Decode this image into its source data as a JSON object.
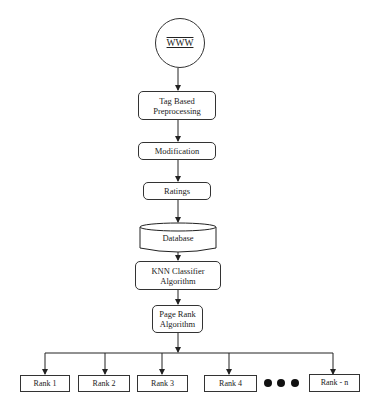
{
  "diagram": {
    "type": "flowchart",
    "nodes": {
      "www": {
        "label": "WWW",
        "shape": "circle"
      },
      "tag_based": {
        "label_line1": "Tag Based",
        "label_line2": "Preprocessing",
        "shape": "rounded-rect"
      },
      "modification": {
        "label": "Modification",
        "shape": "rounded-rect"
      },
      "ratings": {
        "label": "Ratings",
        "shape": "rounded-rect"
      },
      "database": {
        "label": "Database",
        "shape": "cylinder"
      },
      "knn": {
        "label_line1": "KNN Classifier",
        "label_line2": "Algorithm",
        "shape": "rounded-rect"
      },
      "page_rank": {
        "label_line1": "Page Rank",
        "label_line2": "Algorithm",
        "shape": "rounded-rect"
      }
    },
    "ranks": [
      {
        "label": "Rank 1"
      },
      {
        "label": "Rank 2"
      },
      {
        "label": "Rank 3"
      },
      {
        "label": "Rank 4"
      },
      {
        "label": "Rank - n"
      }
    ],
    "ellipsis": "dots-icon",
    "edges": [
      [
        "www",
        "tag_based"
      ],
      [
        "tag_based",
        "modification"
      ],
      [
        "modification",
        "ratings"
      ],
      [
        "ratings",
        "database"
      ],
      [
        "database",
        "knn"
      ],
      [
        "knn",
        "page_rank"
      ],
      [
        "page_rank",
        "rank_1"
      ],
      [
        "page_rank",
        "rank_2"
      ],
      [
        "page_rank",
        "rank_3"
      ],
      [
        "page_rank",
        "rank_4"
      ],
      [
        "page_rank",
        "rank_n"
      ]
    ]
  }
}
